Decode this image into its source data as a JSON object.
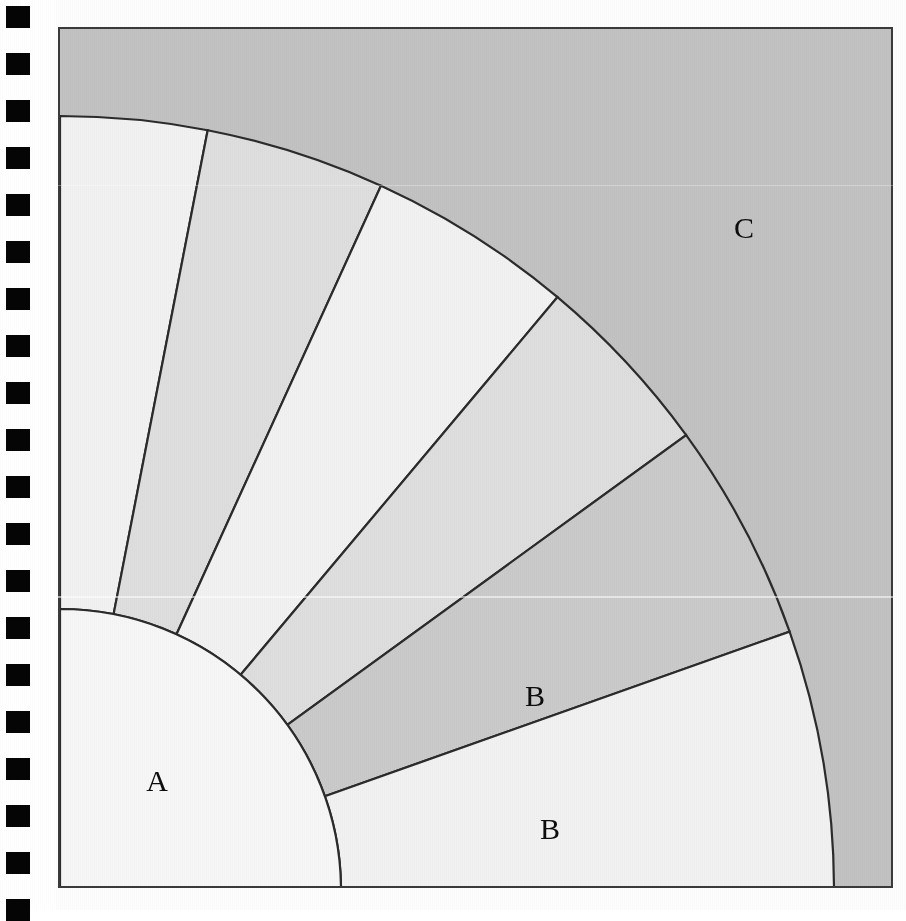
{
  "page": {
    "kind": "scanned-book-page",
    "background_color": "#fdfdfd",
    "width": 906,
    "height": 910
  },
  "binding": {
    "name": "spiral-binding-holes",
    "hole_color": "#050505",
    "hole_count": 20,
    "hole_width": 24,
    "hole_height": 22,
    "hole_left": 6,
    "first_hole_top": 6,
    "hole_pitch": 47
  },
  "figure": {
    "frame": {
      "left": 58,
      "top": 27,
      "width": 835,
      "height": 861,
      "border_color": "#3a3a3a",
      "border_width": 2
    },
    "center": {
      "x": 0,
      "y": 861
    },
    "inner_radius": 281,
    "outer_radius": 774,
    "background_color": "#c2c2c2",
    "line_color": "#2b2b2b",
    "line_width": 2.2,
    "inner_disc_color": "#f6f6f6",
    "palette": {
      "light": "#f1f1f1",
      "medium": "#dedede",
      "dark": "#cacaca",
      "backdrop": "#c2c2c2"
    },
    "sectors": [
      {
        "id": "s1",
        "start_deg": 0,
        "end_deg": 11.0,
        "fill": "light"
      },
      {
        "id": "s2",
        "start_deg": 11.0,
        "end_deg": 24.5,
        "fill": "medium"
      },
      {
        "id": "s3",
        "start_deg": 24.5,
        "end_deg": 40.0,
        "fill": "light"
      },
      {
        "id": "s4",
        "start_deg": 40.0,
        "end_deg": 54.0,
        "fill": "medium"
      },
      {
        "id": "s5",
        "start_deg": 54.0,
        "end_deg": 70.5,
        "fill": "dark"
      },
      {
        "id": "s6",
        "start_deg": 70.5,
        "end_deg": 90.0,
        "fill": "light"
      }
    ],
    "labels": [
      {
        "id": "label-a",
        "text": "A",
        "x": 155,
        "y": 779
      },
      {
        "id": "label-b1",
        "text": "B",
        "x": 533,
        "y": 694
      },
      {
        "id": "label-b2",
        "text": "B",
        "x": 548,
        "y": 827
      },
      {
        "id": "label-c",
        "text": "C",
        "x": 742,
        "y": 226
      }
    ]
  }
}
